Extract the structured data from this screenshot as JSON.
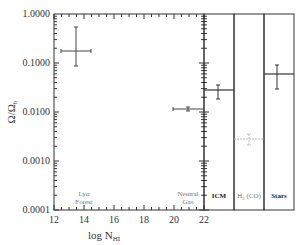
{
  "chart_data": {
    "type": "scatter",
    "title": "",
    "xlabel": "log N_HI",
    "ylabel": "Ω/Ω_b",
    "yscale": "log",
    "ylim": [
      0.0001,
      1.0
    ],
    "xlim": [
      12,
      22
    ],
    "y_ticks": [
      "1.0000",
      "0.1000",
      "0.0100",
      "0.0010",
      "0.0001"
    ],
    "x_ticks": [
      "12",
      "14",
      "16",
      "18",
      "20",
      "22"
    ],
    "grid": false,
    "legend": null,
    "series": [
      {
        "name": "Lyα Forest",
        "x": 13.5,
        "x_err": [
          12.5,
          14.5
        ],
        "y": 0.18,
        "y_err": [
          0.09,
          0.55
        ]
      },
      {
        "name": "Neutral Gas",
        "x": 21.0,
        "x_err": [
          20.2,
          22.0
        ],
        "y": 0.0115,
        "y_err": [
          0.0105,
          0.0125
        ]
      }
    ],
    "panels": [
      {
        "name": "ICM",
        "y": 0.027,
        "y_err": [
          0.019,
          0.037
        ],
        "label_bold": true
      },
      {
        "name": "H2 (CO)",
        "y": 0.0028,
        "y_err": [
          0.0021,
          0.0037
        ],
        "label_bold": false,
        "faint": true
      },
      {
        "name": "Stars",
        "y": 0.06,
        "y_err": [
          0.035,
          0.09
        ],
        "label_bold": true
      }
    ],
    "annotations": [
      "Lyα Forest",
      "Neutral Gas",
      "ICM",
      "H2 (CO)",
      "Stars"
    ]
  },
  "labels": {
    "xlabel_main": "log N",
    "xlabel_sub": "HI",
    "ylabel_main": "Ω/Ω",
    "ylabel_sub": "b",
    "lya_line1": "Lyα",
    "lya_line2": "Forest",
    "ng_line1": "Neutral",
    "ng_line2": "Gas",
    "icm": "ICM",
    "h2_main": "H",
    "h2_sub": "2",
    "h2_rest": " (CO)",
    "stars": "Stars"
  }
}
